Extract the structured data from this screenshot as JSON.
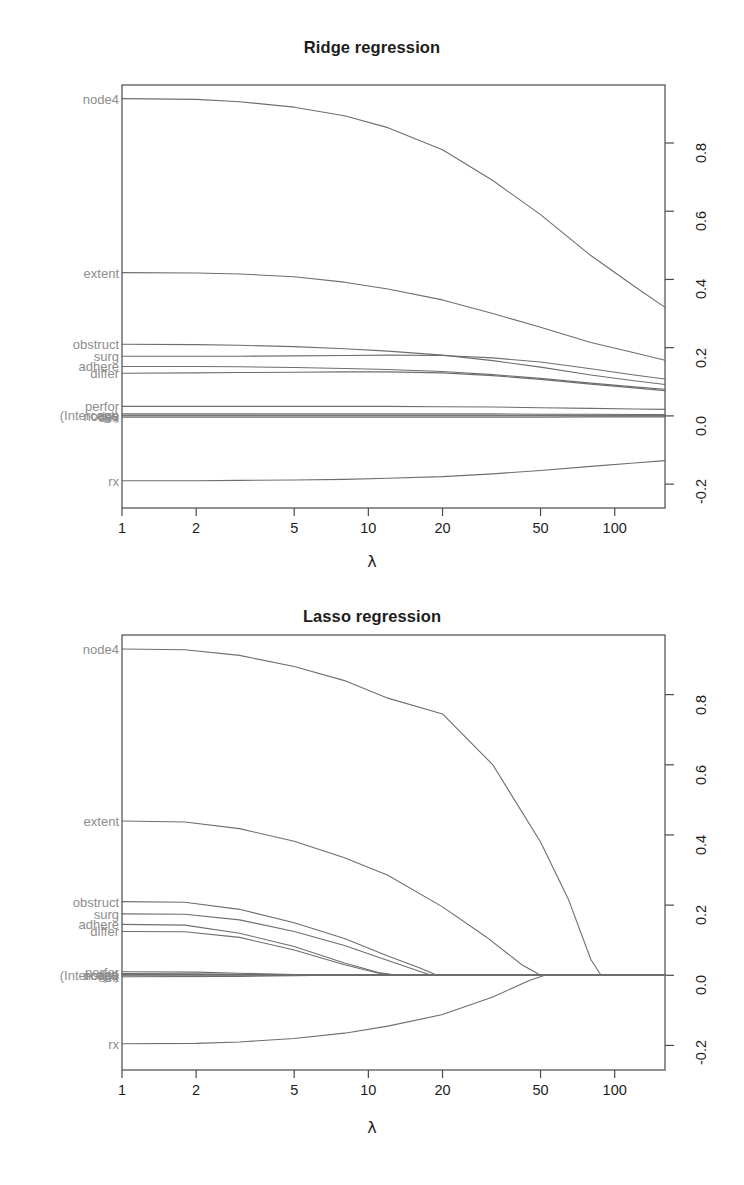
{
  "figure": {
    "background": "#ffffff",
    "line_color": "#6e6e6e",
    "box_color": "#4a4a4a",
    "label_color": "#8d8d8d",
    "panels": [
      "ridge",
      "lasso"
    ]
  },
  "chart_data": [
    {
      "type": "line",
      "id": "ridge",
      "title": "Ridge regression",
      "xlabel": "λ",
      "ylabel": "",
      "xscale": "log",
      "xticks": [
        1,
        2,
        5,
        10,
        20,
        50,
        100
      ],
      "xticklabels": [
        "1",
        "2",
        "5",
        "10",
        "20",
        "50",
        "100"
      ],
      "xlim": [
        1,
        160
      ],
      "yticks": [
        -0.2,
        0.0,
        0.2,
        0.4,
        0.6,
        0.8
      ],
      "yticklabels": [
        "-0.2",
        "0.0",
        "0.2",
        "0.4",
        "0.6",
        "0.8"
      ],
      "ylim": [
        -0.27,
        0.97
      ],
      "grid": false,
      "legend": "left-axis-labels",
      "left_labels": [
        {
          "text": "node4",
          "value": 0.93
        },
        {
          "text": "extent",
          "value": 0.42
        },
        {
          "text": "obstruct",
          "value": 0.21
        },
        {
          "text": "surg",
          "value": 0.175
        },
        {
          "text": "adhere",
          "value": 0.145
        },
        {
          "text": "differ",
          "value": 0.125
        },
        {
          "text": "perfor",
          "value": 0.028
        },
        {
          "text": "(Intercept)",
          "value": 0.002
        },
        {
          "text": "age",
          "value": 0.004
        },
        {
          "text": "nodes",
          "value": 0.0
        },
        {
          "text": "sex",
          "value": -0.004
        },
        {
          "text": "rx",
          "value": -0.19
        }
      ],
      "series": [
        {
          "name": "node4",
          "x": [
            1,
            2,
            3,
            5,
            8,
            12,
            20,
            32,
            50,
            80,
            120,
            160
          ],
          "values": [
            0.93,
            0.928,
            0.921,
            0.905,
            0.88,
            0.845,
            0.78,
            0.69,
            0.59,
            0.47,
            0.38,
            0.318
          ]
        },
        {
          "name": "extent",
          "x": [
            1,
            2,
            3,
            5,
            8,
            12,
            20,
            32,
            50,
            80,
            120,
            160
          ],
          "values": [
            0.42,
            0.419,
            0.416,
            0.408,
            0.392,
            0.372,
            0.34,
            0.3,
            0.26,
            0.215,
            0.185,
            0.163
          ]
        },
        {
          "name": "obstruct",
          "x": [
            1,
            2,
            3,
            5,
            8,
            12,
            20,
            32,
            50,
            80,
            120,
            160
          ],
          "values": [
            0.21,
            0.209,
            0.207,
            0.203,
            0.197,
            0.19,
            0.178,
            0.162,
            0.143,
            0.12,
            0.103,
            0.092
          ]
        },
        {
          "name": "surg",
          "x": [
            1,
            2,
            3,
            5,
            8,
            12,
            20,
            32,
            50,
            80,
            120,
            160
          ],
          "values": [
            0.175,
            0.175,
            0.175,
            0.176,
            0.177,
            0.178,
            0.177,
            0.17,
            0.158,
            0.138,
            0.12,
            0.108
          ]
        },
        {
          "name": "adhere",
          "x": [
            1,
            2,
            3,
            5,
            8,
            12,
            20,
            32,
            50,
            80,
            120,
            160
          ],
          "values": [
            0.145,
            0.145,
            0.144,
            0.142,
            0.139,
            0.136,
            0.13,
            0.121,
            0.11,
            0.096,
            0.085,
            0.078
          ]
        },
        {
          "name": "differ",
          "x": [
            1,
            2,
            3,
            5,
            8,
            12,
            20,
            32,
            50,
            80,
            120,
            160
          ],
          "values": [
            0.125,
            0.126,
            0.127,
            0.128,
            0.129,
            0.129,
            0.126,
            0.118,
            0.107,
            0.093,
            0.082,
            0.074
          ]
        },
        {
          "name": "perfor",
          "x": [
            1,
            2,
            3,
            5,
            8,
            12,
            20,
            32,
            50,
            80,
            120,
            160
          ],
          "values": [
            0.028,
            0.028,
            0.028,
            0.028,
            0.028,
            0.028,
            0.027,
            0.026,
            0.024,
            0.022,
            0.02,
            0.019
          ]
        },
        {
          "name": "age",
          "x": [
            1,
            2,
            3,
            5,
            8,
            12,
            20,
            32,
            50,
            80,
            120,
            160
          ],
          "values": [
            0.006,
            0.006,
            0.006,
            0.006,
            0.006,
            0.006,
            0.006,
            0.006,
            0.005,
            0.005,
            0.004,
            0.004
          ]
        },
        {
          "name": "(Intercept)",
          "x": [
            1,
            2,
            3,
            5,
            8,
            12,
            20,
            32,
            50,
            80,
            120,
            160
          ],
          "values": [
            0.002,
            0.002,
            0.002,
            0.002,
            0.002,
            0.002,
            0.002,
            0.002,
            0.002,
            0.002,
            0.002,
            0.002
          ]
        },
        {
          "name": "nodes",
          "x": [
            1,
            2,
            3,
            5,
            8,
            12,
            20,
            32,
            50,
            80,
            120,
            160
          ],
          "values": [
            0.0,
            0.0,
            0.0,
            0.0,
            0.0,
            0.0,
            0.0,
            0.0,
            0.0,
            0.0,
            0.0,
            0.0
          ]
        },
        {
          "name": "sex",
          "x": [
            1,
            2,
            3,
            5,
            8,
            12,
            20,
            32,
            50,
            80,
            120,
            160
          ],
          "values": [
            -0.004,
            -0.004,
            -0.004,
            -0.004,
            -0.004,
            -0.004,
            -0.004,
            -0.004,
            -0.004,
            -0.003,
            -0.003,
            -0.003
          ]
        },
        {
          "name": "rx",
          "x": [
            1,
            2,
            3,
            5,
            8,
            12,
            20,
            32,
            50,
            80,
            120,
            160
          ],
          "values": [
            -0.19,
            -0.19,
            -0.189,
            -0.188,
            -0.186,
            -0.183,
            -0.178,
            -0.17,
            -0.16,
            -0.148,
            -0.138,
            -0.131
          ]
        }
      ]
    },
    {
      "type": "line",
      "id": "lasso",
      "title": "Lasso regression",
      "xlabel": "λ",
      "ylabel": "",
      "xscale": "log",
      "xticks": [
        1,
        2,
        5,
        10,
        20,
        50,
        100
      ],
      "xticklabels": [
        "1",
        "2",
        "5",
        "10",
        "20",
        "50",
        "100"
      ],
      "xlim": [
        1,
        160
      ],
      "yticks": [
        -0.2,
        0.0,
        0.2,
        0.4,
        0.6,
        0.8
      ],
      "yticklabels": [
        "-0.2",
        "0.0",
        "0.2",
        "0.4",
        "0.6",
        "0.8"
      ],
      "ylim": [
        -0.27,
        0.97
      ],
      "grid": false,
      "legend": "left-axis-labels",
      "left_labels": [
        {
          "text": "node4",
          "value": 0.93
        },
        {
          "text": "extent",
          "value": 0.44
        },
        {
          "text": "obstruct",
          "value": 0.21
        },
        {
          "text": "surg",
          "value": 0.175
        },
        {
          "text": "adhere",
          "value": 0.145
        },
        {
          "text": "differ",
          "value": 0.125
        },
        {
          "text": "(Intercept)",
          "value": 0.002
        },
        {
          "text": "age",
          "value": 0.004
        },
        {
          "text": "perfor",
          "value": 0.01
        },
        {
          "text": "nodes",
          "value": 0.0
        },
        {
          "text": "sex",
          "value": -0.004
        },
        {
          "text": "rx",
          "value": -0.195
        }
      ],
      "series": [
        {
          "name": "node4",
          "x": [
            1,
            1.8,
            3,
            5,
            8,
            12,
            20,
            32,
            50,
            65,
            80,
            88,
            160
          ],
          "values": [
            0.93,
            0.928,
            0.912,
            0.88,
            0.84,
            0.79,
            0.745,
            0.6,
            0.38,
            0.215,
            0.045,
            0.0,
            0.0
          ]
        },
        {
          "name": "extent",
          "x": [
            1,
            1.8,
            3,
            5,
            8,
            12,
            20,
            30,
            42,
            50,
            160
          ],
          "values": [
            0.44,
            0.437,
            0.418,
            0.382,
            0.335,
            0.285,
            0.195,
            0.11,
            0.03,
            0.0,
            0.0
          ]
        },
        {
          "name": "obstruct",
          "x": [
            1,
            1.8,
            3,
            5,
            8,
            12,
            16,
            19,
            160
          ],
          "values": [
            0.21,
            0.208,
            0.188,
            0.15,
            0.105,
            0.055,
            0.022,
            0.0,
            0.0
          ]
        },
        {
          "name": "surg",
          "x": [
            1,
            1.8,
            3,
            5,
            8,
            12,
            16,
            18,
            160
          ],
          "values": [
            0.175,
            0.174,
            0.158,
            0.125,
            0.085,
            0.042,
            0.012,
            0.0,
            0.0
          ]
        },
        {
          "name": "adhere",
          "x": [
            1,
            1.8,
            3,
            5,
            8,
            11,
            13,
            160
          ],
          "values": [
            0.145,
            0.143,
            0.12,
            0.082,
            0.035,
            0.008,
            0.0,
            0.0
          ]
        },
        {
          "name": "differ",
          "x": [
            1,
            1.8,
            3,
            5,
            8,
            11,
            13.5,
            160
          ],
          "values": [
            0.125,
            0.124,
            0.108,
            0.072,
            0.03,
            0.006,
            0.0,
            0.0
          ]
        },
        {
          "name": "perfor",
          "x": [
            1,
            2,
            3,
            5,
            7,
            8,
            160
          ],
          "values": [
            0.01,
            0.009,
            0.006,
            0.002,
            0.0,
            0.0,
            0.0
          ]
        },
        {
          "name": "age",
          "x": [
            1,
            2,
            4,
            7,
            10,
            160
          ],
          "values": [
            0.005,
            0.004,
            0.002,
            0.0,
            0.0,
            0.0
          ]
        },
        {
          "name": "(Intercept)",
          "x": [
            1,
            5,
            20,
            50,
            160
          ],
          "values": [
            0.002,
            0.002,
            0.002,
            0.002,
            0.002
          ]
        },
        {
          "name": "nodes",
          "x": [
            1,
            5,
            20,
            50,
            160
          ],
          "values": [
            0.0,
            0.0,
            0.0,
            0.0,
            0.0
          ]
        },
        {
          "name": "sex",
          "x": [
            1,
            3,
            5,
            7,
            160
          ],
          "values": [
            -0.004,
            -0.003,
            -0.001,
            0.0,
            0.0
          ]
        },
        {
          "name": "rx",
          "x": [
            1,
            2,
            3,
            5,
            8,
            12,
            20,
            32,
            45,
            52,
            160
          ],
          "values": [
            -0.195,
            -0.194,
            -0.19,
            -0.18,
            -0.165,
            -0.145,
            -0.112,
            -0.062,
            -0.015,
            0.0,
            0.0
          ]
        }
      ]
    }
  ]
}
